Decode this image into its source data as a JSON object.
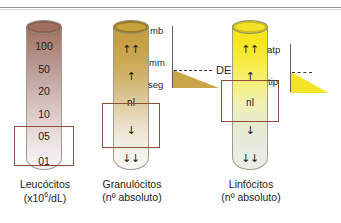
{
  "figure": {
    "background_color": "#ffffff",
    "rule_color": "#9a9a9a"
  },
  "columns": [
    {
      "id": "leucocitos",
      "caption_line1": "Leucócitos",
      "caption_line2_prefix": "(x10",
      "caption_line2_sup": "6",
      "caption_line2_suffix": "/dL)",
      "tube_color_top": "#9d6a5c",
      "tube_color_bottom": "#f8f5f4",
      "scale": [
        "100",
        "50",
        "20",
        "10",
        "05",
        "01"
      ],
      "highlight_box_color": "#8a5038"
    },
    {
      "id": "granulocitos",
      "caption_line1": "Granulócitos",
      "caption_line2": "(nº absoluto)",
      "tube_color_top": "#c49a3f",
      "tube_color_bottom": "#f9f7f2",
      "scale": [
        "↑↑",
        "↑",
        "nl",
        "↓",
        "↓↓"
      ],
      "highlight_box_color": "#8a5038"
    },
    {
      "id": "linfocitos",
      "caption_line1": "Linfócitos",
      "caption_line2": "(nº absoluto)",
      "tube_color_top": "#f5e416",
      "tube_color_bottom": "#ebeee8",
      "scale": [
        "↑↑",
        "↑",
        "nl",
        "↓",
        "↓↓"
      ],
      "highlight_box_color": "#8a5038"
    }
  ],
  "charts": [
    {
      "id": "chart-de",
      "axis_labels": [
        "mb",
        "mm",
        "seg"
      ],
      "annotation": "DE",
      "triangle_color": "#c9a449"
    },
    {
      "id": "chart-tip",
      "axis_labels": [
        "atp",
        "tip"
      ],
      "annotation": "",
      "triangle_color": "#f3e425"
    }
  ],
  "chart_data": {
    "type": "bar",
    "title": "",
    "xlabel": "",
    "ylabel": "",
    "categories": [
      "Leucócitos (x10⁶/dL)",
      "Granulócitos (nº absoluto)",
      "Linfócitos (nº absoluto)"
    ],
    "series": [
      {
        "name": "Leucócitos scale (x10^6/dL)",
        "tick_labels": [
          "100",
          "50",
          "20",
          "10",
          "05",
          "01"
        ],
        "highlighted_range": [
          "05",
          "01"
        ]
      },
      {
        "name": "Granulócitos scale (nº absoluto)",
        "tick_labels": [
          "↑↑",
          "↑",
          "nl",
          "↓",
          "↓↓"
        ],
        "highlighted_range": [
          "↓",
          "↓↓"
        ]
      },
      {
        "name": "Linfócitos scale (nº absoluto)",
        "tick_labels": [
          "↑↑",
          "↑",
          "nl",
          "↓",
          "↓↓"
        ],
        "highlighted_range": [
          "nl",
          "↓"
        ]
      }
    ],
    "inset_diagrams": [
      {
        "name": "DE",
        "axis_ticks_top_to_bottom": [
          "mb",
          "mm",
          "seg"
        ],
        "annotation": "DE",
        "shape": "right triangle decreasing left-to-right",
        "fill": "#c9a449"
      },
      {
        "name": "tip",
        "axis_ticks_top_to_bottom": [
          "atp",
          "tip"
        ],
        "annotation": "",
        "shape": "right triangle decreasing left-to-right",
        "fill": "#f3e425"
      }
    ],
    "grid": false,
    "legend": "none"
  }
}
